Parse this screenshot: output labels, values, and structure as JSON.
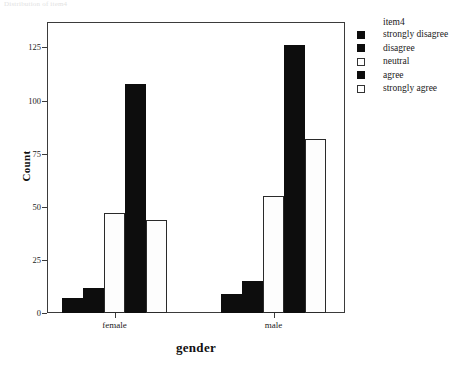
{
  "caption": "Distribution of item4",
  "chart_data": {
    "type": "bar",
    "title": "",
    "xlabel": "gender",
    "ylabel": "Count",
    "categories": [
      "female",
      "male"
    ],
    "ylim": [
      0,
      137
    ],
    "yticks": [
      0,
      25,
      50,
      75,
      100,
      125
    ],
    "ytick_labels": [
      "0",
      "25",
      "50",
      "75",
      "100",
      "125"
    ],
    "grid": false,
    "legend_position": "right",
    "legend_title": "item4",
    "series": [
      {
        "name": "strongly disagree",
        "color": "#0d0d0d",
        "fill": "dark",
        "values": [
          7,
          9
        ]
      },
      {
        "name": "disagree",
        "color": "#0d0d0d",
        "fill": "dark",
        "values": [
          12,
          15
        ]
      },
      {
        "name": "neutral",
        "color": "#ffffff",
        "fill": "light",
        "values": [
          47,
          55
        ]
      },
      {
        "name": "agree",
        "color": "#0d0d0d",
        "fill": "dark",
        "values": [
          108,
          126
        ]
      },
      {
        "name": "strongly agree",
        "color": "#ffffff",
        "fill": "light",
        "values": [
          44,
          82
        ]
      }
    ]
  }
}
